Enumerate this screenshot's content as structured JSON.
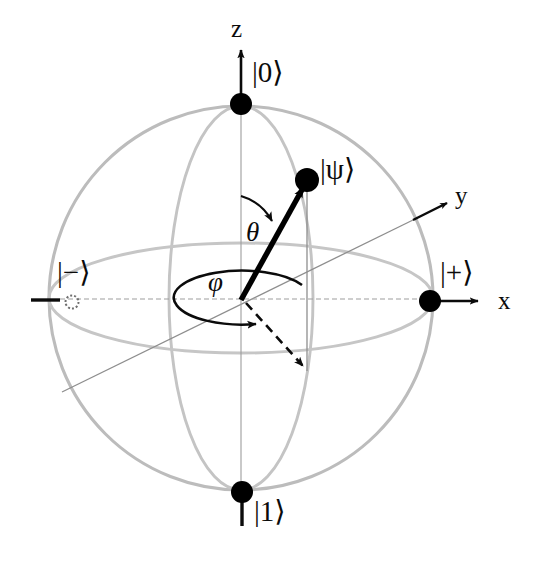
{
  "figure": {
    "kind": "bloch-sphere-diagram",
    "background_color": "#ffffff"
  },
  "colors": {
    "ink": "#0b0b0b",
    "sphere_outline": "#b9b9b9",
    "meridian": "#c2c2c2",
    "equator": "#c4c4c4",
    "thin_guide": "#8e8e8e",
    "axis": "#111111",
    "state_vector": "#000000",
    "marker_fill": "#000000"
  },
  "geometry": {
    "center": {
      "x": 241,
      "y": 298
    },
    "radius": 192,
    "equator_ry": 55,
    "meridian_rx": 72,
    "phi_ellipse": {
      "cx": 240,
      "cy": 298,
      "rx": 68,
      "ry": 27
    },
    "state_point": {
      "x": 307,
      "y": 180
    },
    "projection_point": {
      "x": 307,
      "y": 371
    }
  },
  "axes": [
    {
      "id": "z",
      "label": "z",
      "label_x": 231,
      "label_y": 16,
      "direction": "up"
    },
    {
      "id": "x",
      "label": "x",
      "label_x": 498,
      "label_y": 288,
      "direction": "right"
    },
    {
      "id": "y",
      "label": "y",
      "label_x": 455,
      "label_y": 183,
      "direction": "up-right"
    }
  ],
  "basis_states": [
    {
      "id": "ket-0",
      "label": "|0⟩",
      "label_x": 252,
      "label_y": 58,
      "marker": "filled-dot",
      "marker_x": 241,
      "marker_y": 104
    },
    {
      "id": "ket-1",
      "label": "|1⟩",
      "label_x": 254,
      "label_y": 497,
      "marker": "filled-dot",
      "marker_x": 242,
      "marker_y": 492
    },
    {
      "id": "ket-plus",
      "label": "|+⟩",
      "label_x": 440,
      "label_y": 258,
      "marker": "filled-dot",
      "marker_x": 430,
      "marker_y": 301
    },
    {
      "id": "ket-minus",
      "label": "|−⟩",
      "label_x": 57,
      "label_y": 258,
      "marker": "dotted-circle",
      "marker_x": 72,
      "marker_y": 302
    }
  ],
  "state_vector": {
    "id": "psi",
    "label": "|ψ⟩",
    "label_x": 320,
    "label_y": 155,
    "tip_x": 307,
    "tip_y": 180,
    "origin_x": 241,
    "origin_y": 298,
    "marker": "filled-dot"
  },
  "angles": [
    {
      "id": "theta",
      "label": "θ",
      "label_x": 246,
      "label_y": 219,
      "description": "polar angle from z-axis to state vector",
      "arc_start": {
        "x": 241,
        "y": 196
      },
      "arc_end": {
        "x": 277,
        "y": 224
      }
    },
    {
      "id": "phi",
      "label": "φ",
      "label_x": 208,
      "label_y": 269,
      "description": "azimuthal angle in the xy-plane",
      "arc_end": {
        "x": 262,
        "y": 332
      }
    }
  ],
  "projection": {
    "id": "xy-projection",
    "style": "dashed-arrow",
    "from_x": 241,
    "from_y": 298,
    "to_x": 307,
    "to_y": 371
  },
  "drop_line": {
    "id": "psi-drop-line",
    "from_x": 307,
    "from_y": 182,
    "to_x": 307,
    "to_y": 371
  },
  "guide_line": {
    "id": "y-axis-guide",
    "from_x": 62,
    "from_y": 392,
    "to_x": 413,
    "to_y": 220
  }
}
